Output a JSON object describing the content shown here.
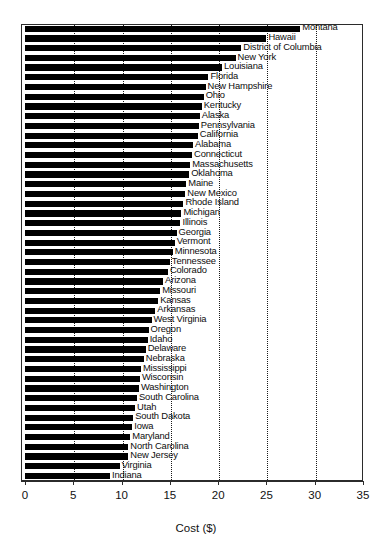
{
  "chart": {
    "type": "bar",
    "orientation": "horizontal",
    "title": "",
    "xlabel": "Cost ($)",
    "ylabel": "",
    "xlim": [
      0,
      35
    ],
    "xticks": [
      0,
      5,
      10,
      15,
      20,
      25,
      30,
      35
    ],
    "xtick_labels": [
      "0",
      "5",
      "10",
      "15",
      "20",
      "25",
      "30",
      "35"
    ],
    "grid": "vertical-dotted",
    "legend": "none",
    "bar_color": "#000000",
    "frame_color": "#2b2b2b"
  },
  "chart_data": {
    "type": "bar",
    "title": "",
    "xlabel": "Cost ($)",
    "ylabel": "",
    "xlim": [
      0,
      35
    ],
    "grid": true,
    "legend": "none",
    "orientation": "horizontal",
    "categories": [
      "Montana",
      "Hawaii",
      "District of Columbia",
      "New York",
      "Louisiana",
      "Florida",
      "New Hampshire",
      "Ohio",
      "Kentucky",
      "Alaska",
      "Pennsylvania",
      "California",
      "Alabama",
      "Connecticut",
      "Massachusetts",
      "Oklahoma",
      "Maine",
      "New Mexico",
      "Rhode Island",
      "Michigan",
      "Illinois",
      "Georgia",
      "Vermont",
      "Minnesota",
      "Tennessee",
      "Colorado",
      "Arizona",
      "Missouri",
      "Kansas",
      "Arkansas",
      "West Virginia",
      "Oregon",
      "Idaho",
      "Delaware",
      "Nebraska",
      "Mississippi",
      "Wisconsin",
      "Washington",
      "South Carolina",
      "Utah",
      "South Dakota",
      "Iowa",
      "Maryland",
      "North Carolina",
      "New Jersey",
      "Virginia",
      "Indiana"
    ],
    "values": [
      28.5,
      25.0,
      22.4,
      21.8,
      20.4,
      19.0,
      18.7,
      18.5,
      18.3,
      18.1,
      18.0,
      17.9,
      17.4,
      17.3,
      17.1,
      17.0,
      16.7,
      16.6,
      16.4,
      16.2,
      16.1,
      15.7,
      15.5,
      15.3,
      15.0,
      14.8,
      14.3,
      14.0,
      13.8,
      13.5,
      13.1,
      12.8,
      12.7,
      12.5,
      12.3,
      12.0,
      11.9,
      11.8,
      11.6,
      11.4,
      11.2,
      11.1,
      10.9,
      10.7,
      10.7,
      9.8,
      8.8
    ]
  }
}
